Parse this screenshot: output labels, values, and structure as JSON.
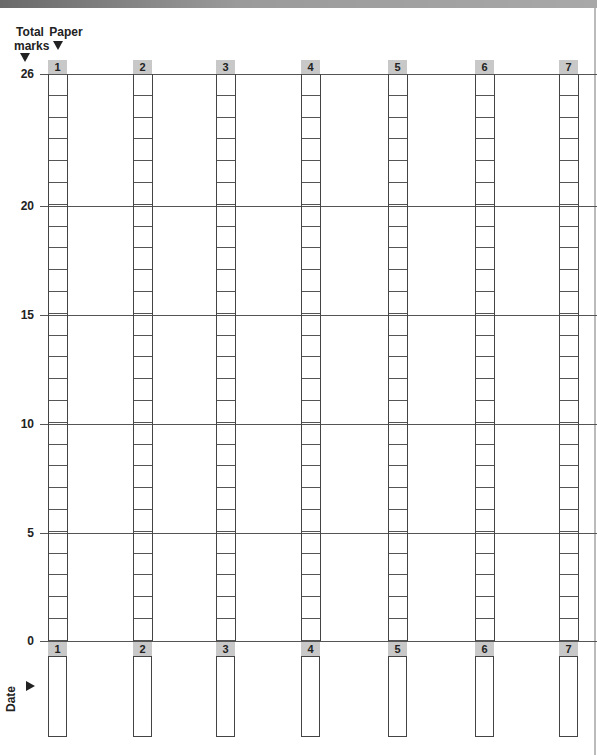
{
  "header": {
    "total_marks_line1": "Total",
    "total_marks_line2": "marks",
    "paper_label": "Paper",
    "date_label": "Date"
  },
  "y_axis": {
    "labels": [
      "26",
      "20",
      "15",
      "10",
      "5",
      "0"
    ]
  },
  "papers": [
    "1",
    "2",
    "3",
    "4",
    "5",
    "6",
    "7"
  ],
  "chart_data": {
    "type": "table",
    "title": "",
    "xlabel": "Paper",
    "ylabel": "Total marks",
    "categories": [
      "1",
      "2",
      "3",
      "4",
      "5",
      "6",
      "7"
    ],
    "ylim": [
      0,
      26
    ],
    "y_ticks": [
      0,
      5,
      10,
      15,
      20,
      26
    ],
    "cells_per_column": 26,
    "values": [
      null,
      null,
      null,
      null,
      null,
      null,
      null
    ],
    "row_label": "Date",
    "dates": [
      "",
      "",
      "",
      "",
      "",
      "",
      ""
    ]
  }
}
